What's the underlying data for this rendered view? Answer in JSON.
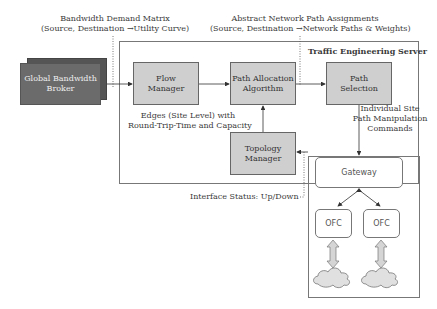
{
  "top_labels": {
    "bandwidth_demand": {
      "line1": "Bandwidth Demand Matrix",
      "line2": "(Source, Destination →Utility Curve)"
    },
    "abstract_paths": {
      "line1": "Abstract Network Path Assignments",
      "line2": "(Source, Destination →Network Paths & Weights)"
    }
  },
  "server": {
    "title": "Traffic Engineering Server"
  },
  "nodes": {
    "broker": {
      "line1": "Global Bandwidth",
      "line2": "Broker"
    },
    "flow_manager": {
      "line1": "Flow",
      "line2": "Manager"
    },
    "path_allocation": {
      "line1": "Path Allocation",
      "line2": "Algorithm"
    },
    "path_selection": {
      "line1": "Path",
      "line2": "Selection"
    },
    "topology_manager": {
      "line1": "Topology",
      "line2": "Manager"
    }
  },
  "annotations": {
    "edges": {
      "line1": "Edges (Site Level) with",
      "line2": "Round-Trip-Time and Capacity"
    },
    "commands": {
      "line1": "Individual Site",
      "line2": "Path Manipulation",
      "line3": "Commands"
    },
    "interface_status": "Interface Status: Up/Down"
  },
  "site": {
    "gateway": "Gateway",
    "ofc_left": "OFC",
    "ofc_right": "OFC"
  },
  "colors": {
    "box_fill": "#cfcfcf",
    "broker_fill": "#6b6b6b",
    "line": "#444444"
  }
}
